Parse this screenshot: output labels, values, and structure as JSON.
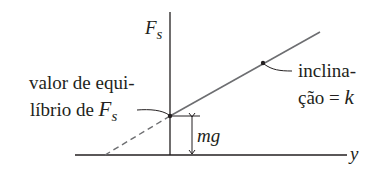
{
  "diagram": {
    "y_axis_label": "F",
    "y_axis_label_sub": "s",
    "x_axis_label": "y",
    "equilibrium_label": {
      "line1": "valor de equi-",
      "line2": "líbrio de ",
      "symbol": "F",
      "symbol_sub": "s"
    },
    "slope_label": {
      "line1": "inclina-",
      "line2": "ção = ",
      "symbol": "k"
    },
    "offset_label": "mg",
    "colors": {
      "axis": "#231f20",
      "line": "#6d6e71",
      "text": "#231f20"
    }
  }
}
